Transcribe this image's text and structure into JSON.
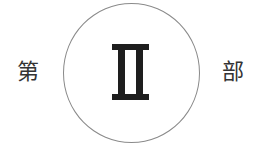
{
  "heading": {
    "prefix": "第",
    "numeral": "II",
    "suffix": "部"
  },
  "colors": {
    "circle_border": "#8a8a8a",
    "numeral": "#1e1e1e",
    "text": "#333333"
  }
}
